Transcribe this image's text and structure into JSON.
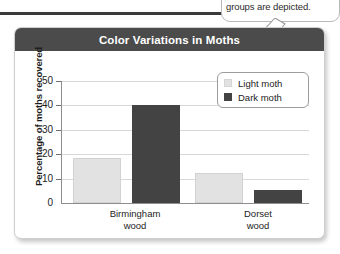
{
  "callout": {
    "text": "groups are depicted.",
    "arrow_icon": "arrow-pointer-icon"
  },
  "card": {
    "title": "Color Variations in Moths"
  },
  "legend": {
    "items": [
      {
        "label": "Light moth",
        "color": "#e2e2e2",
        "swatch_icon": "legend-swatch-light-icon"
      },
      {
        "label": "Dark moth",
        "color": "#434343",
        "swatch_icon": "legend-swatch-dark-icon"
      }
    ]
  },
  "chart_data": {
    "type": "bar",
    "title": "Color Variations in Moths",
    "xlabel": "",
    "ylabel": "Percentage of moths recovered",
    "categories": [
      "Birmingham wood",
      "Dorset wood"
    ],
    "category_lines": [
      [
        "Birmingham",
        "wood"
      ],
      [
        "Dorset",
        "wood"
      ]
    ],
    "series": [
      {
        "name": "Light moth",
        "color": "#e2e2e2",
        "values": [
          18.5,
          12.5
        ]
      },
      {
        "name": "Dark moth",
        "color": "#434343",
        "values": [
          40,
          5.5
        ]
      }
    ],
    "ylim": [
      0,
      50
    ],
    "yticks": [
      0,
      10,
      20,
      30,
      40,
      50
    ],
    "grid": true,
    "legend_position": "top-right"
  }
}
